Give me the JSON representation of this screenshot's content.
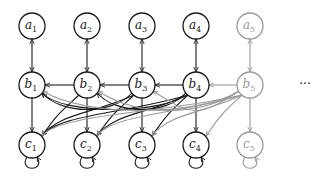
{
  "diagram": {
    "type": "graphical-model",
    "colors": {
      "active": "#1a1a1a",
      "faded": "#9a9a9a"
    },
    "columns_x": [
      32,
      87,
      142,
      196,
      250
    ],
    "rows_y": {
      "a": 26,
      "b": 85,
      "c": 145
    },
    "radius": 13,
    "nodes": [
      {
        "id": "a1",
        "letter": "a",
        "sub": "1",
        "col": 0,
        "row": "a",
        "faded": false
      },
      {
        "id": "a2",
        "letter": "a",
        "sub": "2",
        "col": 1,
        "row": "a",
        "faded": false
      },
      {
        "id": "a3",
        "letter": "a",
        "sub": "3",
        "col": 2,
        "row": "a",
        "faded": false
      },
      {
        "id": "a4",
        "letter": "a",
        "sub": "4",
        "col": 3,
        "row": "a",
        "faded": false
      },
      {
        "id": "a5",
        "letter": "a",
        "sub": "5",
        "col": 4,
        "row": "a",
        "faded": true
      },
      {
        "id": "b1",
        "letter": "b",
        "sub": "1",
        "col": 0,
        "row": "b",
        "faded": false
      },
      {
        "id": "b2",
        "letter": "b",
        "sub": "2",
        "col": 1,
        "row": "b",
        "faded": false
      },
      {
        "id": "b3",
        "letter": "b",
        "sub": "3",
        "col": 2,
        "row": "b",
        "faded": false
      },
      {
        "id": "b4",
        "letter": "b",
        "sub": "4",
        "col": 3,
        "row": "b",
        "faded": false
      },
      {
        "id": "b5",
        "letter": "b",
        "sub": "5",
        "col": 4,
        "row": "b",
        "faded": true
      },
      {
        "id": "c1",
        "letter": "c",
        "sub": "1",
        "col": 0,
        "row": "c",
        "faded": false
      },
      {
        "id": "c2",
        "letter": "c",
        "sub": "2",
        "col": 1,
        "row": "c",
        "faded": false
      },
      {
        "id": "c3",
        "letter": "c",
        "sub": "3",
        "col": 2,
        "row": "c",
        "faded": false
      },
      {
        "id": "c4",
        "letter": "c",
        "sub": "4",
        "col": 3,
        "row": "c",
        "faded": false
      },
      {
        "id": "c5",
        "letter": "c",
        "sub": "5",
        "col": 4,
        "row": "c",
        "faded": true
      }
    ],
    "edges_description": [
      "a_i <-> b_i bidirectional vertical",
      "b_{i+1} -> b_i horizontal leftward",
      "b_i -> c_i vertical",
      "b_j -> c_i curved for i < j",
      "b_5 -> b_i curved (faded) for i < 4",
      "c_i self-loop"
    ],
    "ellipsis": "···",
    "ellipsis_pos": {
      "x": 305,
      "y": 88
    }
  }
}
